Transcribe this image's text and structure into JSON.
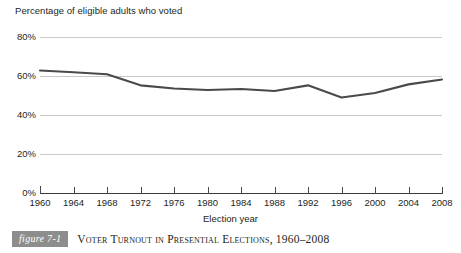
{
  "chart_data": {
    "type": "line",
    "title": "Percentage of eligible adults who voted",
    "xlabel": "Election year",
    "ylabel": "",
    "categories": [
      "1960",
      "1964",
      "1968",
      "1972",
      "1976",
      "1980",
      "1984",
      "1988",
      "1992",
      "1996",
      "2000",
      "2004",
      "2008"
    ],
    "x": [
      1960,
      1964,
      1968,
      1972,
      1976,
      1980,
      1984,
      1988,
      1992,
      1996,
      2000,
      2004,
      2008
    ],
    "values": [
      62.8,
      61.9,
      60.9,
      55.2,
      53.6,
      52.8,
      53.3,
      52.3,
      55.2,
      49.0,
      51.3,
      55.7,
      58.2
    ],
    "series": [
      {
        "name": "Voter turnout",
        "values": [
          62.8,
          61.9,
          60.9,
          55.2,
          53.6,
          52.8,
          53.3,
          52.3,
          55.2,
          49.0,
          51.3,
          55.7,
          58.2
        ]
      }
    ],
    "ylim": [
      0,
      80
    ],
    "xlim": [
      1960,
      2008
    ],
    "ytick_labels": [
      "0%",
      "20%",
      "40%",
      "60%",
      "80%"
    ],
    "ytick_values": [
      0,
      20,
      40,
      60,
      80
    ],
    "grid": true,
    "legend": "none",
    "line_color": "#4a4a4a",
    "grid_color": "#c9c9c9",
    "axis_color": "#3a3a3a"
  },
  "figure": {
    "badge_label": "figure 7-1",
    "caption": "Voter Turnout in Presential Elections, 1960–2008"
  }
}
